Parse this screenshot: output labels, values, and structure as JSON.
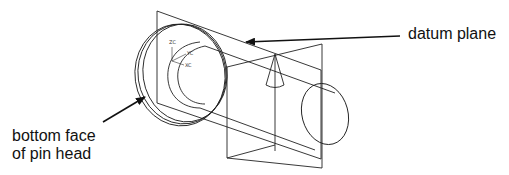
{
  "figure": {
    "labels": {
      "datum_plane": "datum plane",
      "bottom_face_line1": "bottom face",
      "bottom_face_line2": "of pin head"
    },
    "csys": {
      "zc": "ZC",
      "yc": "YC",
      "xc": "XC"
    },
    "colors": {
      "line": "#222222",
      "arrow": "#111111",
      "background": "#ffffff"
    }
  }
}
